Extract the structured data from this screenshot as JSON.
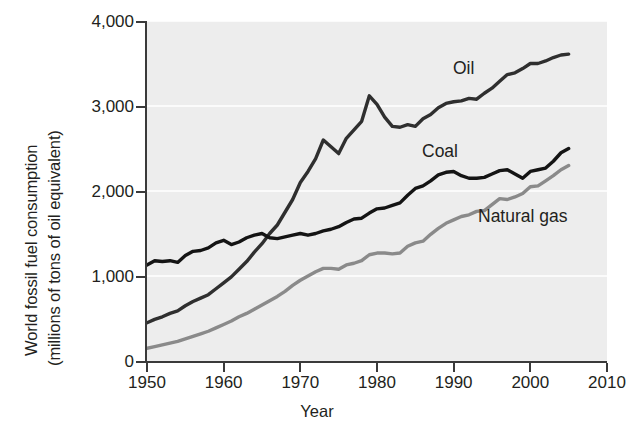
{
  "chart_data": {
    "type": "line",
    "title": "",
    "xlabel": "Year",
    "ylabel": "World fossil fuel consumption (millions of tons of oil equivalent)",
    "ylabel_line1": "World fossil fuel consumption",
    "ylabel_line2": "(millions of tons of oil equivalent)",
    "xlim": [
      1950,
      2010
    ],
    "ylim": [
      0,
      4000
    ],
    "xticks": [
      1950,
      1960,
      1970,
      1980,
      1990,
      2000,
      2010
    ],
    "xtick_labels": [
      "1950",
      "1960",
      "1970",
      "1980",
      "1990",
      "2000",
      "2010"
    ],
    "yticks": [
      0,
      1000,
      2000,
      3000,
      4000
    ],
    "ytick_labels": [
      "0",
      "1,000",
      "2,000",
      "3,000",
      "4,000"
    ],
    "grid": "horizontal-white-on-gray",
    "legend_position": "inline-annotations",
    "plot_background": "#ededed",
    "x": [
      1950,
      1951,
      1952,
      1953,
      1954,
      1955,
      1956,
      1957,
      1958,
      1959,
      1960,
      1961,
      1962,
      1963,
      1964,
      1965,
      1966,
      1967,
      1968,
      1969,
      1970,
      1971,
      1972,
      1973,
      1974,
      1975,
      1976,
      1977,
      1978,
      1979,
      1980,
      1981,
      1982,
      1983,
      1984,
      1985,
      1986,
      1987,
      1988,
      1989,
      1990,
      1991,
      1992,
      1993,
      1994,
      1995,
      1996,
      1997,
      1998,
      1999,
      2000,
      2001,
      2002,
      2003,
      2004,
      2005
    ],
    "series": [
      {
        "name": "Oil",
        "color": "#2f2f2f",
        "values": [
          450,
          490,
          520,
          560,
          590,
          650,
          700,
          740,
          780,
          850,
          920,
          990,
          1080,
          1170,
          1280,
          1380,
          1500,
          1600,
          1750,
          1900,
          2100,
          2230,
          2380,
          2600,
          2520,
          2440,
          2620,
          2720,
          2820,
          3120,
          3020,
          2870,
          2760,
          2750,
          2780,
          2760,
          2850,
          2900,
          2980,
          3030,
          3050,
          3060,
          3090,
          3080,
          3150,
          3210,
          3290,
          3370,
          3390,
          3440,
          3500,
          3500,
          3530,
          3570,
          3600,
          3610
        ]
      },
      {
        "name": "Coal",
        "color": "#141414",
        "values": [
          1130,
          1180,
          1170,
          1180,
          1160,
          1240,
          1290,
          1300,
          1330,
          1390,
          1420,
          1370,
          1400,
          1450,
          1480,
          1500,
          1450,
          1440,
          1460,
          1480,
          1500,
          1480,
          1500,
          1530,
          1550,
          1580,
          1630,
          1670,
          1680,
          1740,
          1790,
          1800,
          1830,
          1860,
          1950,
          2030,
          2060,
          2120,
          2190,
          2220,
          2230,
          2180,
          2150,
          2150,
          2160,
          2200,
          2240,
          2250,
          2200,
          2150,
          2230,
          2250,
          2270,
          2350,
          2450,
          2500
        ]
      },
      {
        "name": "Natural gas",
        "color": "#8a8a8a",
        "values": [
          150,
          170,
          190,
          210,
          230,
          260,
          290,
          320,
          350,
          390,
          430,
          470,
          520,
          560,
          610,
          660,
          710,
          760,
          820,
          890,
          950,
          1000,
          1050,
          1090,
          1090,
          1080,
          1130,
          1150,
          1180,
          1250,
          1270,
          1270,
          1260,
          1270,
          1350,
          1390,
          1410,
          1490,
          1560,
          1620,
          1660,
          1700,
          1720,
          1760,
          1770,
          1840,
          1910,
          1900,
          1930,
          1970,
          2050,
          2060,
          2120,
          2180,
          2250,
          2300
        ]
      }
    ]
  },
  "annotations": {
    "oil": "Oil",
    "coal": "Coal",
    "natural_gas": "Natural gas"
  }
}
